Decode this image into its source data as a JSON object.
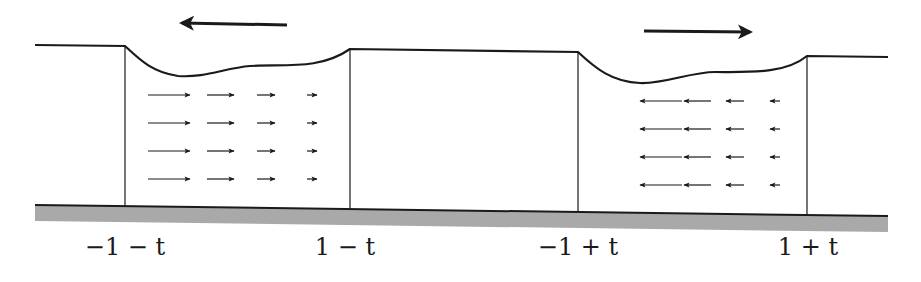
{
  "diagram": {
    "colors": {
      "line": "#1a1a1a",
      "ground": "#a9a9a9",
      "background": "#ffffff"
    },
    "labels": [
      {
        "id": "left-outer",
        "text": "−1 − t",
        "x": 125
      },
      {
        "id": "left-inner",
        "text": "1 − t",
        "x": 345
      },
      {
        "id": "right-inner",
        "text": "−1 + t",
        "x": 578
      },
      {
        "id": "right-outer",
        "text": "1 + t",
        "x": 808
      }
    ],
    "motion_arrows": [
      {
        "id": "left-block-motion",
        "direction": "left",
        "x1": 287,
        "x2": 180,
        "y": 25
      },
      {
        "id": "right-block-motion",
        "direction": "right",
        "x1": 644,
        "x2": 752,
        "y": 31
      }
    ],
    "blocks": [
      {
        "id": "left-block",
        "x_left": 125,
        "x_right": 350,
        "flow_direction": "right",
        "rows_y": [
          95,
          123,
          151,
          179
        ],
        "columns": [
          {
            "x_start": 148,
            "length": 42
          },
          {
            "x_start": 207,
            "length": 27
          },
          {
            "x_start": 257,
            "length": 18
          },
          {
            "x_start": 307,
            "length": 10
          }
        ]
      },
      {
        "id": "right-block",
        "x_left": 578,
        "x_right": 807,
        "flow_direction": "left",
        "rows_y": [
          101,
          129,
          157,
          185
        ],
        "columns": [
          {
            "x_start": 640,
            "length": 42
          },
          {
            "x_start": 684,
            "length": 27
          },
          {
            "x_start": 726,
            "length": 18
          },
          {
            "x_start": 770,
            "length": 10
          }
        ]
      }
    ]
  }
}
